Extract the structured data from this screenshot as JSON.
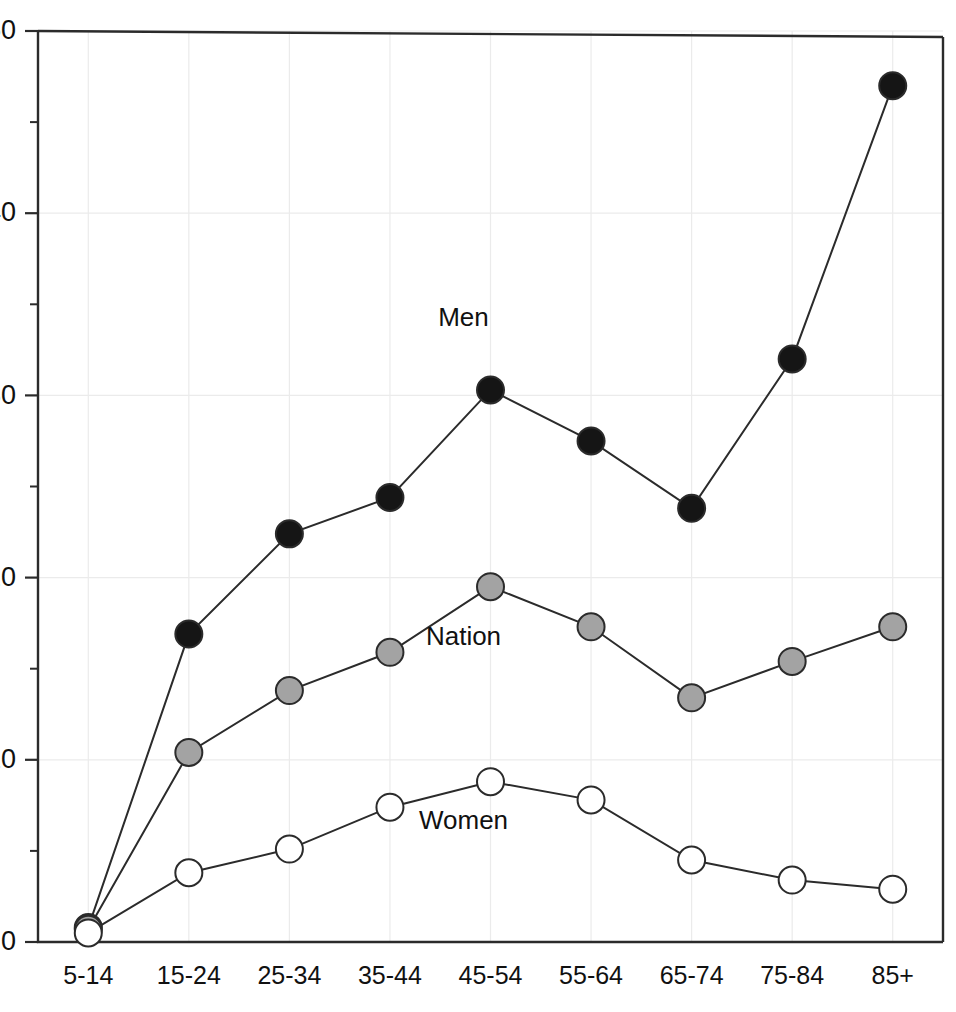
{
  "chart_data": {
    "type": "line",
    "title": "",
    "subtitle": "",
    "xlabel": "",
    "ylabel": "",
    "categories": [
      "5-14",
      "15-24",
      "25-34",
      "35-44",
      "45-54",
      "55-64",
      "65-74",
      "75-84",
      "85+"
    ],
    "ylim": [
      0,
      50
    ],
    "ytick_labels": [
      "0",
      "10",
      "20",
      "30",
      "40",
      "50"
    ],
    "ytick_values": [
      0,
      10,
      20,
      30,
      40,
      50
    ],
    "yminor_values": [
      5,
      15,
      25,
      35,
      45
    ],
    "grid": "faint major gridlines, horizontal and vertical",
    "legend_position": "inline annotations next to series",
    "series": [
      {
        "name": "Men",
        "marker": "filled-black-circle",
        "marker_color": "#151515",
        "annotation": "Men",
        "annotation_category": "45-54",
        "annotation_value": 33.8,
        "values": [
          0.8,
          16.9,
          22.4,
          24.4,
          30.3,
          27.5,
          23.8,
          32.0,
          47.0
        ]
      },
      {
        "name": "Nation",
        "marker": "filled-gray-circle",
        "marker_color": "#a3a3a3",
        "annotation": "Nation",
        "annotation_category": "45-54",
        "annotation_value": 16.3,
        "values": [
          0.7,
          10.4,
          13.8,
          15.9,
          19.5,
          17.3,
          13.4,
          15.4,
          17.3
        ]
      },
      {
        "name": "Women",
        "marker": "open-white-circle",
        "marker_color": "#ffffff",
        "annotation": "Women",
        "annotation_category": "45-54",
        "annotation_value": 6.2,
        "values": [
          0.5,
          3.8,
          5.1,
          7.4,
          8.8,
          7.8,
          4.5,
          3.4,
          2.9
        ]
      }
    ]
  },
  "axes": {
    "y_axis_name": "y-axis",
    "x_axis_name": "x-axis"
  }
}
